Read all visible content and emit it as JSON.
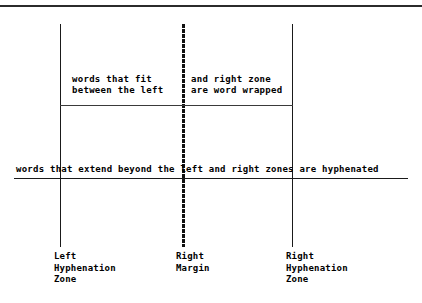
{
  "figure": {
    "background_color": "#ffffff",
    "ink_color": "#000000"
  },
  "body_text": {
    "wrapped_left": {
      "line1": "words that fit",
      "line2": "between the left"
    },
    "wrapped_right": {
      "line1": "and right zone",
      "line2": "are word wrapped"
    },
    "hyphenated": "words that extend beyond the left and right zones are hyphenated"
  },
  "labels": {
    "left_hyphenation_zone": {
      "line1": "Left",
      "line2": "Hyphenation",
      "line3": "Zone"
    },
    "right_margin": {
      "line1": "Right",
      "line2": "Margin"
    },
    "right_hyphenation_zone": {
      "line1": "Right",
      "line2": "Hyphenation",
      "line3": "Zone"
    }
  }
}
